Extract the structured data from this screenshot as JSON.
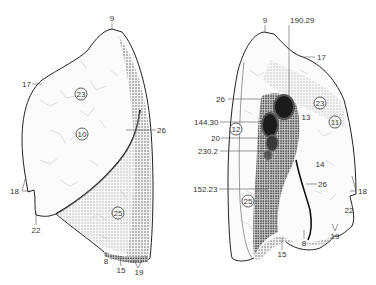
{
  "figure": {
    "type": "anatomical-illustration",
    "colors": {
      "ink": "#222222",
      "shade": "#6e6e6e",
      "paper": "#ffffff"
    }
  },
  "left_view": {
    "labels": {
      "apex": "9",
      "upper_left": "17",
      "right_edge": "26",
      "left_notch": "18",
      "bottom_left": "22",
      "bottom_a": "8",
      "bottom_b": "15",
      "bottom_c": "19"
    },
    "circled": {
      "upper_lobe_a": "23",
      "upper_lobe_b": "10",
      "lower_lobe": "25"
    }
  },
  "right_view": {
    "labels": {
      "apex": "9",
      "vessel_top": "190.29",
      "upper_right": "17",
      "left_26": "26",
      "left_144": "144.30",
      "left_20": "20",
      "left_230": "230.2",
      "left_152": "152.23",
      "hilum_13": "13",
      "mid_14": "14",
      "mid_26": "26",
      "right_18": "18",
      "right_22": "22",
      "bottom_19": "19",
      "bottom_8": "8",
      "bottom_15": "15"
    },
    "circled": {
      "upper_23": "23",
      "upper_11": "11",
      "left_12": "12",
      "lower_25": "25"
    }
  }
}
